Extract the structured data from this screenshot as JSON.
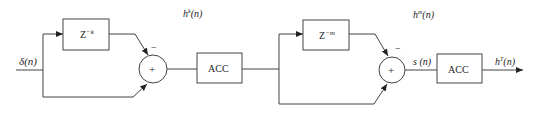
{
  "diagram": {
    "type": "block-diagram",
    "input_label": {
      "base": "δ",
      "arg": "(n)"
    },
    "stage1": {
      "delay_block": {
        "base": "Z",
        "exponent": "−k"
      },
      "sum_symbol": "+",
      "minus_sign": "−",
      "acc_label": "ACC",
      "output_label": {
        "base": "h",
        "sup": "k",
        "arg": "(n)"
      }
    },
    "stage2": {
      "delay_block": {
        "base": "Z",
        "exponent": "−m"
      },
      "sum_symbol": "+",
      "minus_sign": "−",
      "sum_output_label": {
        "base": "s",
        "arg": " (n)"
      },
      "acc_label": "ACC",
      "top_label": {
        "base": "h",
        "sup": "m",
        "arg": "(n)"
      },
      "output_label": {
        "base": "h",
        "sup": "T",
        "arg": "(n)"
      }
    },
    "colors": {
      "stroke": "#333333",
      "text": "#222222",
      "background": "#ffffff"
    }
  }
}
